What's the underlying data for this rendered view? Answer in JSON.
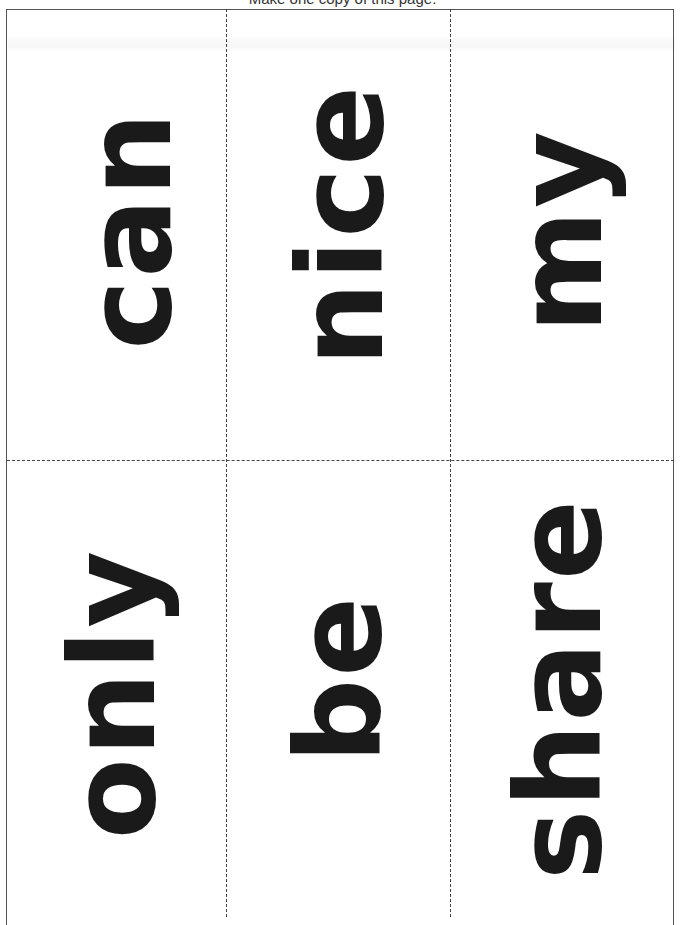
{
  "page": {
    "instruction": "Make one copy of this page."
  },
  "cards": [
    {
      "word": "can",
      "row": 1,
      "col": 1
    },
    {
      "word": "nice",
      "row": 1,
      "col": 2
    },
    {
      "word": "my",
      "row": 1,
      "col": 3
    },
    {
      "word": "only",
      "row": 2,
      "col": 1
    },
    {
      "word": "be",
      "row": 2,
      "col": 2
    },
    {
      "word": "share",
      "row": 2,
      "col": 3
    }
  ],
  "style": {
    "text_color": "#1a1a1a",
    "border_color": "#555555",
    "cut_line_color": "#444444",
    "background": "#ffffff"
  }
}
